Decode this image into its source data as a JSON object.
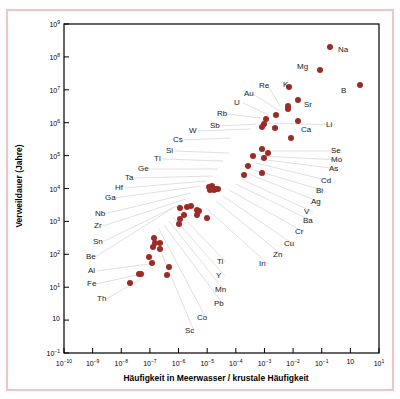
{
  "figure": {
    "border_color": "#f3c3c6",
    "marker_color": "#9c2b26",
    "leader_color": "#dcdcdc",
    "axis_color": "#000000"
  },
  "axes": {
    "x_title": "Häufigkeit in Meerwasser / krustale Häufigkeit",
    "y_title": "Verweildauer (Jahre)",
    "x_tick_labels": [
      "10-10",
      "10-9",
      "10-8",
      "10-7",
      "10-6",
      "10-5",
      "10-4",
      "10-3",
      "10-2",
      "10-1",
      "10",
      "101"
    ],
    "y_tick_labels": [
      "109",
      "108",
      "107",
      "106",
      "105",
      "104",
      "103",
      "102",
      "101",
      "10",
      "10-1"
    ]
  },
  "chart_data": {
    "type": "scatter",
    "title": "",
    "xlabel": "Häufigkeit in Meerwasser / krustale Häufigkeit",
    "ylabel": "Verweildauer (Jahre)",
    "xscale": "log",
    "yscale": "log",
    "xlim": [
      1e-10,
      10
    ],
    "ylim": [
      0.1,
      1000000000
    ],
    "grid": false,
    "legend": "none",
    "x_ticks": [
      1e-10,
      1e-09,
      1e-08,
      1e-07,
      1e-06,
      1e-05,
      0.0001,
      0.001,
      0.01,
      0.1,
      1,
      10
    ],
    "y_ticks": [
      1000000000,
      100000000,
      10000000,
      1000000,
      100000,
      10000,
      1000,
      100,
      10,
      1,
      0.1
    ],
    "point_labels": [
      "Na",
      "Mg",
      "B",
      "K",
      "Sr",
      "Li",
      "Ca",
      "Re",
      "Au",
      "U",
      "Rb",
      "Sb",
      "W",
      "Cs",
      "Si",
      "Tl",
      "Ge",
      "Ta",
      "Hf",
      "Ga",
      "Nb",
      "Zr",
      "Sn",
      "Be",
      "Al",
      "Fe",
      "Th",
      "Se",
      "Mo",
      "As",
      "Cd",
      "Bi",
      "Ag",
      "V",
      "Ba",
      "Cr",
      "Cu",
      "Zn",
      "In",
      "Ti",
      "Y",
      "Mn",
      "Pb",
      "Co",
      "Sc"
    ],
    "points": [
      {
        "label": "Na",
        "x": 0.2,
        "y": 200000000.0
      },
      {
        "label": "Mg",
        "x": 0.09,
        "y": 40000000.0
      },
      {
        "label": "B",
        "x": 2.2,
        "y": 14000000.0
      },
      {
        "label": "K",
        "x": 0.007,
        "y": 12000000.0
      },
      {
        "label": "Sr",
        "x": 0.015,
        "y": 5000000.0
      },
      {
        "label": "Re",
        "x": 0.0065,
        "y": 3200000.0
      },
      {
        "label": "Au",
        "x": 0.0065,
        "y": 2600000.0
      },
      {
        "label": "U",
        "x": 0.0026,
        "y": 1700000.0
      },
      {
        "label": "Rb",
        "x": 0.0011,
        "y": 1300000.0
      },
      {
        "label": "Ca",
        "x": 0.015,
        "y": 1100000.0
      },
      {
        "label": "Li",
        "x": 0.001,
        "y": 900000.0
      },
      {
        "label": "Sb",
        "x": 0.00085,
        "y": 750000.0
      },
      {
        "label": "W",
        "x": 0.0023,
        "y": 700000.0
      },
      {
        "label": "Se",
        "x": 0.0085,
        "y": 350000.0
      },
      {
        "label": "Mo",
        "x": 0.0004,
        "y": 100000.0
      },
      {
        "label": "As",
        "x": 0.0008,
        "y": 160000.0
      },
      {
        "label": "Cd",
        "x": 0.0013,
        "y": 120000.0
      },
      {
        "label": "Bi",
        "x": 0.001,
        "y": 85000.0
      },
      {
        "label": "Cs",
        "x": 0.00026,
        "y": 50000.0
      },
      {
        "label": "Ag",
        "x": 0.0008,
        "y": 30000.0
      },
      {
        "label": "Ba",
        "x": 0.0002,
        "y": 26000.0
      },
      {
        "label": "V",
        "x": 1.5e-05,
        "y": 12000.0
      },
      {
        "label": "Si",
        "x": 1.4e-05,
        "y": 10000.0
      },
      {
        "label": "Cr",
        "x": 1.7e-05,
        "y": 9000.0
      },
      {
        "label": "Cu",
        "x": 2e-05,
        "y": 9500.0
      },
      {
        "label": "Zn",
        "x": 2.3e-05,
        "y": 10000.0
      },
      {
        "label": "Ge",
        "x": 1.3e-05,
        "y": 9000.0
      },
      {
        "label": "Tl",
        "x": 1.2e-05,
        "y": 11000.0
      },
      {
        "label": "Ni",
        "x": 2.8e-06,
        "y": 3000.0
      },
      {
        "label": "In",
        "x": 2e-06,
        "y": 2800.0
      },
      {
        "label": "Ga",
        "x": 1.1e-06,
        "y": 2500.0
      },
      {
        "label": "Ti",
        "x": 4.5e-06,
        "y": 2200.0
      },
      {
        "label": "Nb",
        "x": 5e-06,
        "y": 2000.0
      },
      {
        "label": "Zr",
        "x": 1.6e-06,
        "y": 1600.0
      },
      {
        "label": "Y",
        "x": 1.1e-06,
        "y": 1200.0
      },
      {
        "label": "Mn",
        "x": 4.5e-06,
        "y": 1600.0
      },
      {
        "label": "Sn",
        "x": 1e-05,
        "y": 1300.0
      },
      {
        "label": "Pb",
        "x": 1e-06,
        "y": 850.0
      },
      {
        "label": "Hf",
        "x": 1.4e-07,
        "y": 320.0
      },
      {
        "label": "Ta",
        "x": 1.5e-07,
        "y": 220.0
      },
      {
        "label": "Be",
        "x": 2.2e-07,
        "y": 220.0
      },
      {
        "label": "Co",
        "x": 1.3e-07,
        "y": 170.0
      },
      {
        "label": "Th",
        "x": 2.2e-07,
        "y": 150.0
      },
      {
        "label": "Sc",
        "x": 9e-08,
        "y": 80.0
      },
      {
        "label": "Al",
        "x": 1.2e-07,
        "y": 55.0
      },
      {
        "label": "Fe",
        "x": 4.5e-07,
        "y": 40.0
      },
      {
        "label": "Pa",
        "x": 4e-08,
        "y": 25.0
      },
      {
        "label": "Ce",
        "x": 5e-08,
        "y": 26.0
      },
      {
        "label": "Mn2",
        "x": 4e-07,
        "y": 24.0
      },
      {
        "label": "Fe2",
        "x": 2e-08,
        "y": 13.0
      }
    ]
  },
  "annotations": [
    {
      "name": "Na",
      "lx": 337,
      "ly": 44,
      "dx": 322,
      "dy": 47,
      "leader": false
    },
    {
      "name": "Mg",
      "lx": 296,
      "ly": 61,
      "dx": 310,
      "dy": 70,
      "leader": false
    },
    {
      "name": "B",
      "lx": 340,
      "ly": 85,
      "dx": 330,
      "dy": 85,
      "leader": false
    },
    {
      "name": "K",
      "lx": 282,
      "ly": 79,
      "dx": 290,
      "dy": 87,
      "leader": true
    },
    {
      "name": "Sr",
      "lx": 303,
      "ly": 99,
      "dx": 295,
      "dy": 101,
      "leader": false
    },
    {
      "name": "Re",
      "lx": 258,
      "ly": 80,
      "dx": 279,
      "dy": 105,
      "leader": true
    },
    {
      "name": "Au",
      "lx": 243,
      "ly": 88,
      "dx": 279,
      "dy": 110,
      "leader": true
    },
    {
      "name": "U",
      "lx": 233,
      "ly": 97,
      "dx": 268,
      "dy": 114,
      "leader": true
    },
    {
      "name": "Rb",
      "lx": 216,
      "ly": 108,
      "dx": 260,
      "dy": 117,
      "leader": true
    },
    {
      "name": "Ca",
      "lx": 300,
      "ly": 124,
      "dx": 286,
      "dy": 121,
      "leader": false
    },
    {
      "name": "Li",
      "lx": 325,
      "ly": 119,
      "dx": 265,
      "dy": 122,
      "leader": true
    },
    {
      "name": "Sb",
      "lx": 209,
      "ly": 120,
      "dx": 255,
      "dy": 123,
      "leader": true
    },
    {
      "name": "W",
      "lx": 188,
      "ly": 125,
      "dx": 250,
      "dy": 128,
      "leader": true
    },
    {
      "name": "Cs",
      "lx": 172,
      "ly": 134,
      "dx": 230,
      "dy": 137,
      "leader": true
    },
    {
      "name": "Si",
      "lx": 165,
      "ly": 145,
      "dx": 228,
      "dy": 152,
      "leader": true
    },
    {
      "name": "Tl",
      "lx": 153,
      "ly": 153,
      "dx": 222,
      "dy": 160,
      "leader": true
    },
    {
      "name": "Ge",
      "lx": 137,
      "ly": 163,
      "dx": 217,
      "dy": 168,
      "leader": true
    },
    {
      "name": "Ta",
      "lx": 124,
      "ly": 172,
      "dx": 212,
      "dy": 175,
      "leader": true
    },
    {
      "name": "Hf",
      "lx": 114,
      "ly": 182,
      "dx": 205,
      "dy": 180,
      "leader": true
    },
    {
      "name": "Ga",
      "lx": 104,
      "ly": 192,
      "dx": 200,
      "dy": 185,
      "leader": true
    },
    {
      "name": "Nb",
      "lx": 94,
      "ly": 208,
      "dx": 190,
      "dy": 192,
      "leader": true
    },
    {
      "name": "Zr",
      "lx": 93,
      "ly": 220,
      "dx": 185,
      "dy": 198,
      "leader": true
    },
    {
      "name": "Sn",
      "lx": 92,
      "ly": 236,
      "dx": 180,
      "dy": 203,
      "leader": true
    },
    {
      "name": "Be",
      "lx": 85,
      "ly": 251,
      "dx": 172,
      "dy": 207,
      "leader": true
    },
    {
      "name": "Al",
      "lx": 87,
      "ly": 265,
      "dx": 155,
      "dy": 262,
      "leader": true
    },
    {
      "name": "Fe",
      "lx": 86,
      "ly": 278,
      "dx": 145,
      "dy": 272,
      "leader": true
    },
    {
      "name": "Th",
      "lx": 96,
      "ly": 293,
      "dx": 140,
      "dy": 278,
      "leader": true
    },
    {
      "name": "Se",
      "lx": 330,
      "ly": 145,
      "dx": 262,
      "dy": 150,
      "leader": true
    },
    {
      "name": "Mo",
      "lx": 330,
      "ly": 154,
      "dx": 260,
      "dy": 155,
      "leader": true
    },
    {
      "name": "As",
      "lx": 328,
      "ly": 163,
      "dx": 258,
      "dy": 158,
      "leader": true
    },
    {
      "name": "Cd",
      "lx": 320,
      "ly": 175,
      "dx": 255,
      "dy": 162,
      "leader": true
    },
    {
      "name": "Bi",
      "lx": 315,
      "ly": 185,
      "dx": 250,
      "dy": 168,
      "leader": true
    },
    {
      "name": "Ag",
      "lx": 310,
      "ly": 196,
      "dx": 245,
      "dy": 172,
      "leader": true
    },
    {
      "name": "V",
      "lx": 303,
      "ly": 206,
      "dx": 240,
      "dy": 178,
      "leader": true
    },
    {
      "name": "Ba",
      "lx": 302,
      "ly": 215,
      "dx": 235,
      "dy": 183,
      "leader": true
    },
    {
      "name": "Cr",
      "lx": 294,
      "ly": 226,
      "dx": 228,
      "dy": 189,
      "leader": true
    },
    {
      "name": "Cu",
      "lx": 283,
      "ly": 238,
      "dx": 222,
      "dy": 195,
      "leader": true
    },
    {
      "name": "Zn",
      "lx": 272,
      "ly": 249,
      "dx": 215,
      "dy": 200,
      "leader": true
    },
    {
      "name": "In",
      "lx": 258,
      "ly": 258,
      "dx": 205,
      "dy": 207,
      "leader": true
    },
    {
      "name": "Ti",
      "lx": 216,
      "ly": 256,
      "dx": 178,
      "dy": 212,
      "leader": true
    },
    {
      "name": "Y",
      "lx": 215,
      "ly": 270,
      "dx": 172,
      "dy": 216,
      "leader": true
    },
    {
      "name": "Mn",
      "lx": 214,
      "ly": 284,
      "dx": 168,
      "dy": 220,
      "leader": true
    },
    {
      "name": "Pb",
      "lx": 213,
      "ly": 298,
      "dx": 163,
      "dy": 224,
      "leader": true
    },
    {
      "name": "Co",
      "lx": 196,
      "ly": 312,
      "dx": 158,
      "dy": 228,
      "leader": true
    },
    {
      "name": "Sc",
      "lx": 184,
      "ly": 325,
      "dx": 152,
      "dy": 232,
      "leader": true
    }
  ]
}
